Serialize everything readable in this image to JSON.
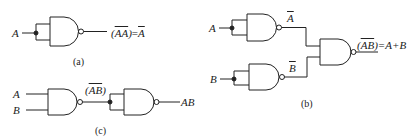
{
  "diagram": {
    "type": "logic-gate-schematic",
    "stroke_color": "#222222",
    "background": "#ffffff",
    "panels": [
      {
        "id": "a",
        "caption": "(a)",
        "inputs": [
          "A"
        ],
        "gates": [
          "NAND (inputs tied)"
        ],
        "output_label_lhs": "(AA)",
        "output_label_rhs": "=A",
        "output_expression": "(̅A̅A̅)=Ā"
      },
      {
        "id": "b",
        "caption": "(b)",
        "inputs": [
          "A",
          "B"
        ],
        "intermediate_labels": [
          "A",
          "B"
        ],
        "gates": [
          "NAND (A tied)",
          "NAND (B tied)",
          "NAND"
        ],
        "output_label_lhs": "(AB)",
        "output_label_rhs": "=A+B"
      },
      {
        "id": "c",
        "caption": "(c)",
        "inputs": [
          "A",
          "B"
        ],
        "intermediate_label": "(AB)",
        "gates": [
          "NAND",
          "NAND (inputs tied)"
        ],
        "output_label": "AB"
      }
    ]
  },
  "labels": {
    "a_input": "A",
    "a_out_open": "(",
    "a_out_A1": "A",
    "a_out_A2": "A",
    "a_out_close": ")",
    "a_out_eq": "=",
    "a_out_rhs": "A",
    "a_caption": "(a)",
    "b_input_a": "A",
    "b_input_b": "B",
    "b_mid_a": "A",
    "b_mid_b": "B",
    "b_out_open": "(",
    "b_out_A": "A",
    "b_out_B": "B",
    "b_out_close": ")",
    "b_out_rhs": "=A+B",
    "b_caption": "(b)",
    "c_input_a": "A",
    "c_input_b": "B",
    "c_mid_open": "(",
    "c_mid_AB": "AB",
    "c_mid_close": ")",
    "c_output": "AB",
    "c_caption": "(c)"
  }
}
